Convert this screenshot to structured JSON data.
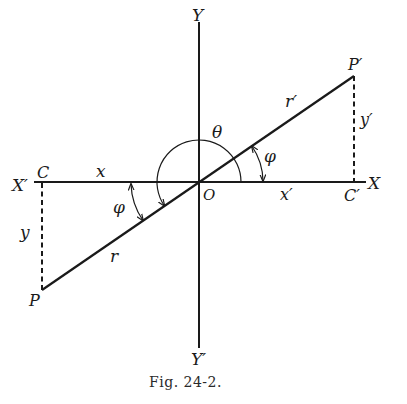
{
  "figure": {
    "caption": "Fig. 24-2.",
    "labels": {
      "y_axis_top": "Y",
      "y_axis_bottom": "Y′",
      "x_axis_right": "X",
      "x_axis_left": "X′",
      "origin": "O",
      "point_p": "P",
      "point_p_prime": "P′",
      "point_c": "C",
      "point_c_prime": "C′",
      "segment_x": "x",
      "segment_x_prime": "x′",
      "segment_y": "y",
      "segment_y_prime": "y′",
      "segment_r": "r",
      "segment_r_prime": "r′",
      "angle_theta": "θ",
      "angle_phi_left": "φ",
      "angle_phi_right": "φ"
    },
    "colors": {
      "ink": "#1a1a1a",
      "background": "#ffffff"
    }
  }
}
